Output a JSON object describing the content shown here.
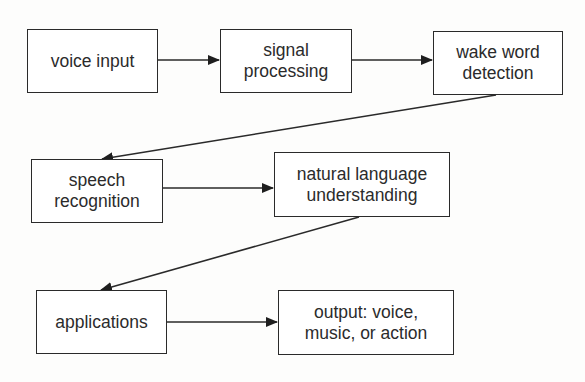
{
  "diagram": {
    "type": "flowchart",
    "colors": {
      "line": "#2a2a2a",
      "text": "#2b2b2b",
      "box_fill": "#ffffff",
      "background": "#fdfdfc"
    },
    "nodes": [
      {
        "id": "voice_input",
        "label": "voice input"
      },
      {
        "id": "signal_processing",
        "label": "signal\nprocessing"
      },
      {
        "id": "wake_word_detection",
        "label": "wake word\ndetection"
      },
      {
        "id": "speech_recognition",
        "label": "speech\nrecognition"
      },
      {
        "id": "natural_language_understanding",
        "label": "natural language\nunderstanding"
      },
      {
        "id": "applications",
        "label": "applications"
      },
      {
        "id": "output",
        "label": "output: voice,\nmusic, or action"
      }
    ],
    "edges": [
      {
        "from": "voice_input",
        "to": "signal_processing"
      },
      {
        "from": "signal_processing",
        "to": "wake_word_detection"
      },
      {
        "from": "wake_word_detection",
        "to": "speech_recognition"
      },
      {
        "from": "speech_recognition",
        "to": "natural_language_understanding"
      },
      {
        "from": "natural_language_understanding",
        "to": "applications"
      },
      {
        "from": "applications",
        "to": "output"
      }
    ]
  }
}
